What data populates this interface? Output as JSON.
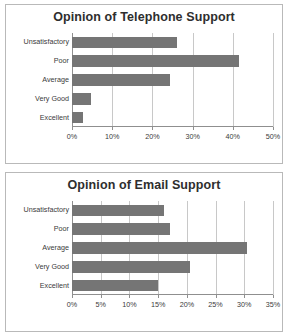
{
  "charts": [
    {
      "id": "chart-top",
      "title": "Opinion of Telephone Support"
    },
    {
      "id": "chart-bottom",
      "title": "Opinion of Email Support"
    }
  ],
  "chart_data": [
    {
      "type": "bar",
      "orientation": "horizontal",
      "title": "Opinion of Telephone Support",
      "xlabel": "",
      "ylabel": "",
      "categories": [
        "Unsatisfactory",
        "Poor",
        "Average",
        "Very Good",
        "Excellent"
      ],
      "values": [
        26,
        41.5,
        24.5,
        4.7,
        2.8
      ],
      "xlim": [
        0,
        50
      ],
      "xticks": [
        0,
        10,
        20,
        30,
        40,
        50
      ],
      "xticklabels": [
        "0%",
        "10%",
        "20%",
        "30%",
        "40%",
        "50%"
      ],
      "grid": true,
      "legend": false,
      "bar_color": "#757575"
    },
    {
      "type": "bar",
      "orientation": "horizontal",
      "title": "Opinion of Email Support",
      "xlabel": "",
      "ylabel": "",
      "categories": [
        "Unsatisfactory",
        "Poor",
        "Average",
        "Very Good",
        "Excellent"
      ],
      "values": [
        16.0,
        17.0,
        30.5,
        20.5,
        15.0
      ],
      "xlim": [
        0,
        35
      ],
      "xticks": [
        0,
        5,
        10,
        15,
        20,
        25,
        30,
        35
      ],
      "xticklabels": [
        "0%",
        "5%",
        "10%",
        "15%",
        "20%",
        "25%",
        "30%",
        "35%"
      ],
      "grid": true,
      "legend": false,
      "bar_color": "#757575"
    }
  ]
}
